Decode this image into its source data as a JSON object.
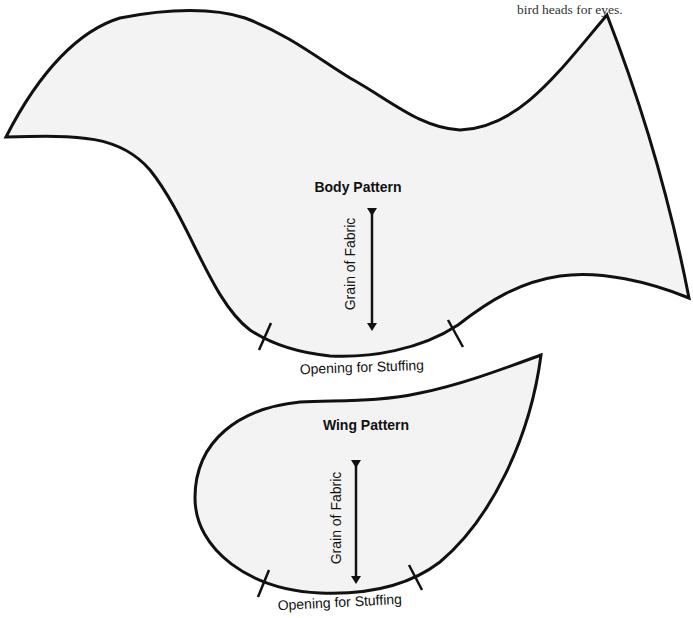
{
  "caption": "bird heads for eyes.",
  "body_pattern": {
    "title": "Body Pattern",
    "grain_label": "Grain of Fabric",
    "opening_label": "Opening for Stuffing"
  },
  "wing_pattern": {
    "title": "Wing Pattern",
    "grain_label": "Grain of Fabric",
    "opening_label": "Opening for Stuffing"
  },
  "colors": {
    "fill": "#f3f3f3",
    "stroke": "#111111",
    "background": "#ffffff"
  }
}
